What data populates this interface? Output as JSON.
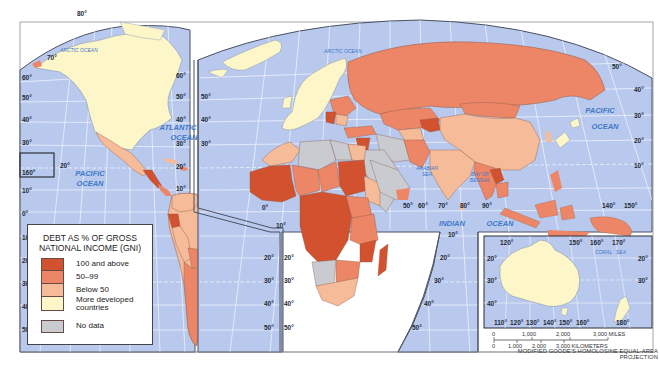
{
  "map": {
    "title": "Debt as % of Gross National Income (GNI)",
    "projection": "MODIFIED GOODE'S HOMOLOSINE EQUAL-AREA PROJECTION",
    "colors": {
      "ocean": "#b9c9ee",
      "grid": "#ffffff",
      "border": "#4a5160",
      "class_100_above": "#d2512f",
      "class_50_99": "#ec8666",
      "class_below_50": "#f6bb98",
      "more_developed": "#fdf6c8",
      "no_data": "#c9cbd1",
      "ocean_label": "#3f78c8"
    },
    "legend": {
      "title_line1": "DEBT AS % OF GROSS",
      "title_line2": "NATIONAL INCOME (GNI)",
      "items": [
        {
          "label": "100 and above",
          "color": "#d2512f"
        },
        {
          "label": "50–99",
          "color": "#ec8666"
        },
        {
          "label": "Below 50",
          "color": "#f6bb98"
        },
        {
          "label_line1": "More developed",
          "label_line2": "countries",
          "color": "#fdf6c8"
        },
        {
          "label": "No data",
          "color": "#c9cbd1"
        }
      ]
    },
    "oceans": [
      {
        "name": "ARCTIC OCEAN",
        "x": 60,
        "y": 52
      },
      {
        "name": "ATLANTIC OCEAN",
        "x": 196,
        "y": 130
      },
      {
        "name": "PACIFIC OCEAN",
        "x": 84,
        "y": 178
      },
      {
        "name": "ARCTIC OCEAN",
        "x": 340,
        "y": 50
      },
      {
        "name": "ARABIAN SEA",
        "x": 424,
        "y": 172
      },
      {
        "name": "BAY OF BENGAL",
        "x": 478,
        "y": 177
      },
      {
        "name": "INDIAN OCEAN",
        "x": 466,
        "y": 223
      },
      {
        "name": "PACIFIC OCEAN",
        "x": 600,
        "y": 113
      },
      {
        "name": "CORAL SEA",
        "x": 606,
        "y": 255
      }
    ],
    "latitude_labels": {
      "left_outer": [
        "60°",
        "50°",
        "40°",
        "30°",
        "20°",
        "10°",
        "0°",
        "10°",
        "20°",
        "30°",
        "40°",
        "50°"
      ],
      "americas_right": [
        "60°",
        "50°",
        "40°",
        "30°",
        "20°",
        "10°"
      ],
      "south_america_right": [
        "20°",
        "30°",
        "40°",
        "50°"
      ],
      "africa_left": [
        "50°",
        "40°",
        "30°",
        "20°",
        "30°",
        "40°",
        "50°"
      ],
      "africa_right": [
        "10°",
        "20°",
        "30°",
        "40°",
        "50°"
      ],
      "asia_right": [
        "50°",
        "40°",
        "30°",
        "20°",
        "10°"
      ]
    },
    "longitude_labels": {
      "arctic": [
        "80°",
        "70°"
      ],
      "hawaii_inset": "160°",
      "indian_ocean": [
        "50°",
        "60°",
        "70°",
        "80°",
        "90°"
      ],
      "pacific": [
        "140°",
        "150°"
      ],
      "australia_top": [
        "120°",
        "150°",
        "160°",
        "170°"
      ],
      "australia_bottom": [
        "110°",
        "120°",
        "130°",
        "140°",
        "150°",
        "160°",
        "180°"
      ]
    },
    "misc_labels": {
      "hawaii_20": "20°",
      "africa_0": "0°",
      "africa_10": "10°",
      "indian_10": "10°"
    },
    "australia_lat": [
      "20°",
      "30°",
      "40°"
    ],
    "australia_lat_right": [
      "20°",
      "30°"
    ],
    "scale_bar": {
      "miles": [
        "0",
        "1,000",
        "2,000",
        "3,000 MILES"
      ],
      "kilometers": [
        "0",
        "1,000",
        "2,000",
        "3,000 KILOMETERS"
      ]
    }
  }
}
